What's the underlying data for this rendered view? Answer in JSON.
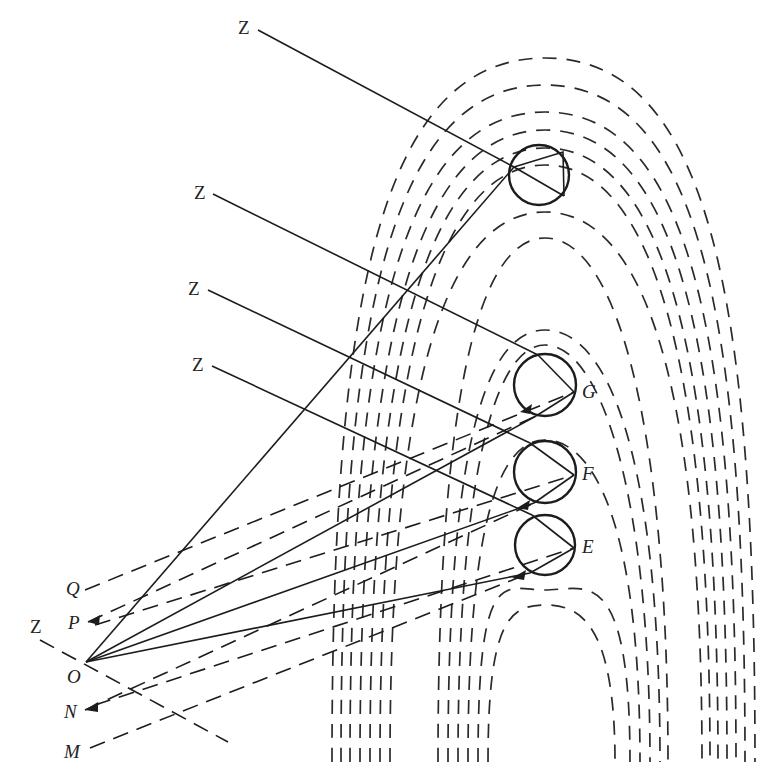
{
  "figure": {
    "type": "geometric-optics-diagram",
    "colors": {
      "ink": "#1c1c1c",
      "background": "#ffffff"
    }
  },
  "labels": {
    "z_top": "Z",
    "z_2": "Z",
    "z_3": "Z",
    "z_4": "Z",
    "z_left": "Z",
    "g": "G",
    "f": "F",
    "e": "E",
    "q": "Q",
    "p": "P",
    "o": "O",
    "n": "N",
    "m": "M"
  },
  "bodies": [
    {
      "id": "top",
      "cx": 539,
      "cy": 175,
      "r": 30,
      "label": ""
    },
    {
      "id": "G",
      "cx": 545,
      "cy": 385,
      "r": 31,
      "label": "G"
    },
    {
      "id": "F",
      "cx": 545,
      "cy": 472,
      "r": 31,
      "label": "F"
    },
    {
      "id": "E",
      "cx": 545,
      "cy": 545,
      "r": 30,
      "label": "E"
    }
  ],
  "points": {
    "O": [
      86,
      662
    ],
    "Q": [
      85,
      590
    ],
    "P": [
      88,
      622
    ],
    "N": [
      85,
      710
    ],
    "M": [
      90,
      748
    ]
  }
}
